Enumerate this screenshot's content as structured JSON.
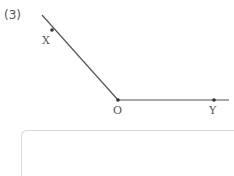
{
  "problem": {
    "number": "(3)",
    "points": [
      {
        "name": "X",
        "x": 52,
        "y": 30
      },
      {
        "name": "O",
        "x": 118,
        "y": 100
      },
      {
        "name": "Y",
        "x": 214,
        "y": 100
      }
    ],
    "rays": [
      {
        "from": "O",
        "through": "X",
        "label": "ray OX"
      },
      {
        "from": "O",
        "through": "Y",
        "label": "ray OY"
      }
    ],
    "line_color": "#555555",
    "answer_box": {
      "border_color": "#d8d8d8"
    }
  }
}
